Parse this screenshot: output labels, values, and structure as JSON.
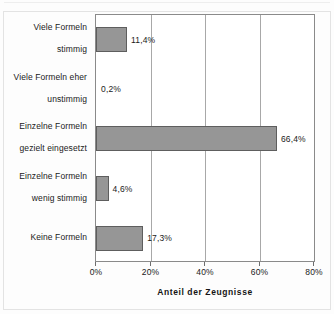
{
  "chart_data": {
    "type": "bar",
    "orientation": "horizontal",
    "title": "",
    "xlabel": "Anteil der Zeugnisse",
    "ylabel": "",
    "xlim": [
      0,
      80
    ],
    "xticks": [
      "0%",
      "20%",
      "40%",
      "60%",
      "80%"
    ],
    "xtick_values": [
      0,
      20,
      40,
      60,
      80
    ],
    "grid": true,
    "legend": false,
    "categories": [
      "Viele Formeln stimmig",
      "Viele Formeln eher unstimmig",
      "Einzelne Formeln gezielt eingesetzt",
      "Einzelne Formeln wenig stimmig",
      "Keine Formeln"
    ],
    "values": [
      11.4,
      0.2,
      66.4,
      4.6,
      17.3
    ],
    "data_labels": [
      "11,4%",
      "0,2%",
      "66,4%",
      "4,6%",
      "17,3%"
    ],
    "bars": [
      {
        "category_line1": "Viele Formeln",
        "category_line2": "stimmig",
        "value": 11.4,
        "label": "11,4%"
      },
      {
        "category_line1": "Viele Formeln eher",
        "category_line2": "unstimmig",
        "value": 0.2,
        "label": "0,2%"
      },
      {
        "category_line1": "Einzelne Formeln",
        "category_line2": "gezielt eingesetzt",
        "value": 66.4,
        "label": "66,4%"
      },
      {
        "category_line1": "Einzelne Formeln",
        "category_line2": "wenig stimmig",
        "value": 4.6,
        "label": "4,6%"
      },
      {
        "category_line1": "Keine Formeln",
        "category_line2": "",
        "value": 17.3,
        "label": "17,3%"
      }
    ],
    "colors": {
      "bar_fill": "#969696",
      "bar_border": "#5e5e5e",
      "gridline": "#a8a8a8",
      "axis": "#8a8a8a",
      "text": "#1a1a1a",
      "background": "#ffffff"
    }
  }
}
